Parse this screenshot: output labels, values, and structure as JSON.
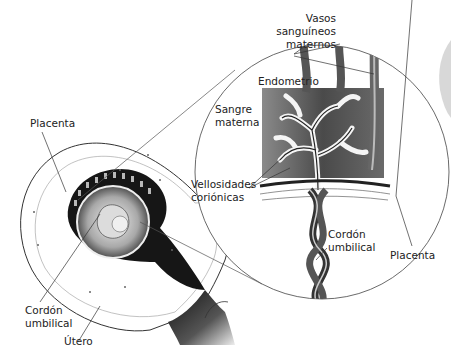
{
  "diagram": {
    "labels": {
      "vasos_line1": "Vasos",
      "vasos_line2": "sanguíneos",
      "vasos_line3": "maternos",
      "endometrio": "Endometrio",
      "sangre_line1": "Sangre",
      "sangre_line2": "materna",
      "vellosidades_line1": "Vellosidades",
      "vellosidades_line2": "coriónicas",
      "placenta_right": "Placenta",
      "cordon_right_line1": "Cordón",
      "cordon_right_line2": "umbilical",
      "placenta_left": "Placenta",
      "cordon_left_line1": "Cordón",
      "cordon_left_line2": "umbilical",
      "utero": "Útero"
    },
    "colors": {
      "line": "#333333",
      "tissue_dark": "#1a1a1a",
      "tissue_gray": "#6e6e6e",
      "blood_region": "#5a5a5a",
      "background": "#ffffff",
      "edge_shade": "#d0d0d0"
    }
  }
}
